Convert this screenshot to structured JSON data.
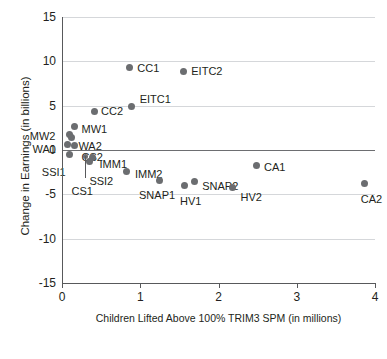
{
  "chart_data": {
    "type": "scatter",
    "title": "",
    "xlabel": "Children Lifted Above 100% TRIM3 SPM (in millions)",
    "ylabel": "Change in Earnings (in billions)",
    "xlim": [
      0,
      4
    ],
    "ylim": [
      -15,
      15
    ],
    "xticks": [
      "0",
      "1",
      "2",
      "3",
      "4"
    ],
    "yticks": [
      "15",
      "10",
      "5",
      "0",
      "-5",
      "-10",
      "-15"
    ],
    "grid": true,
    "legend": "none",
    "marker_color": "#6b6d70",
    "zero_line": 0,
    "points": [
      {
        "label": "CC1",
        "x": 0.86,
        "y": 9.3,
        "lx": 8,
        "ly": -5
      },
      {
        "label": "EITC2",
        "x": 1.55,
        "y": 8.9,
        "lx": 8,
        "ly": -5
      },
      {
        "label": "EITC1",
        "x": 0.89,
        "y": 4.9,
        "lx": 8,
        "ly": -13
      },
      {
        "label": "CC2",
        "x": 0.41,
        "y": 4.3,
        "lx": 7,
        "ly": -6
      },
      {
        "label": "MW1",
        "x": 0.16,
        "y": 2.6,
        "lx": 7,
        "ly": -3
      },
      {
        "label": "MW2",
        "x": 0.1,
        "y": 1.8,
        "lx": -40,
        "ly": -3
      },
      {
        "label": "WA2",
        "x": 0.12,
        "y": 1.4,
        "lx": 7,
        "ly": 3
      },
      {
        "label": "WA1",
        "x": 0.07,
        "y": 0.6,
        "lx": -35,
        "ly": -1
      },
      {
        "label": "CS2",
        "x": 0.16,
        "y": 0.5,
        "lx": 7,
        "ly": 6
      },
      {
        "label": "SSI1",
        "x": 0.1,
        "y": -0.5,
        "lx": -28,
        "ly": 13
      },
      {
        "label": "CS1",
        "x": 0.3,
        "y": -0.7,
        "lx": -14,
        "ly": 30
      },
      {
        "label": "IMM1",
        "x": 0.39,
        "y": -0.8,
        "lx": 7,
        "ly": 2
      },
      {
        "label": "SSI2",
        "x": 0.35,
        "y": -1.3,
        "lx": 0,
        "ly": 14
      },
      {
        "label": "IMM2",
        "x": 0.83,
        "y": -2.4,
        "lx": 8,
        "ly": -2
      },
      {
        "label": "SNAP1",
        "x": 1.24,
        "y": -3.4,
        "lx": -20,
        "ly": 10
      },
      {
        "label": "SNAP2",
        "x": 1.69,
        "y": -3.6,
        "lx": 8,
        "ly": -1
      },
      {
        "label": "HV1",
        "x": 1.56,
        "y": -4.0,
        "lx": -4,
        "ly": 11
      },
      {
        "label": "HV2",
        "x": 2.18,
        "y": -4.2,
        "lx": 8,
        "ly": 5
      },
      {
        "label": "CA1",
        "x": 2.48,
        "y": -1.7,
        "lx": 8,
        "ly": -3
      },
      {
        "label": "CA2",
        "x": 3.87,
        "y": -3.8,
        "lx": -4,
        "ly": 10
      }
    ]
  }
}
